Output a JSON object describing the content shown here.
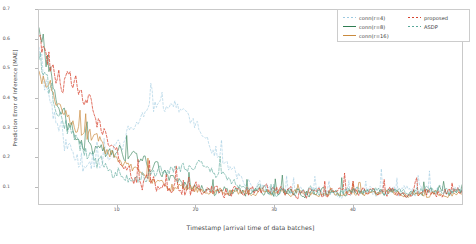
{
  "chart_data": {
    "type": "line",
    "title": "",
    "xlabel": "Timestamp [arrival time of data batches]",
    "ylabel": "Prediction Error of Inference [MAE]",
    "xlim": [
      0,
      54
    ],
    "ylim": [
      0.04,
      0.7
    ],
    "xticks": [
      10,
      20,
      30,
      40
    ],
    "yticks": [
      0.1,
      0.2,
      0.3,
      0.4,
      0.5,
      0.6,
      0.7
    ],
    "grid": false,
    "legend_position": "top-right",
    "n_points": 300,
    "series": [
      {
        "name": "conn(r=4)",
        "color": "#9ecae1",
        "dash": "2,2",
        "width": 0.6,
        "start": 0.6,
        "floor": 0.082,
        "decay": 0.052,
        "noise": 0.052,
        "seed": 11,
        "spike": 0.3,
        "spike_center": 0.3,
        "spike_width": 0.13
      },
      {
        "name": "conn(r=8)",
        "color": "#2f7d52",
        "dash": "0",
        "width": 0.6,
        "start": 0.66,
        "floor": 0.08,
        "decay": 0.075,
        "noise": 0.04,
        "seed": 27,
        "spike": 0.1,
        "spike_center": 0.22,
        "spike_width": 0.1
      },
      {
        "name": "conn(r=16)",
        "color": "#c98a3e",
        "dash": "0",
        "width": 0.7,
        "start": 0.5,
        "floor": 0.074,
        "decay": 0.11,
        "noise": 0.026,
        "seed": 43,
        "spike": 0.06,
        "spike_center": 0.14,
        "spike_width": 0.09
      },
      {
        "name": "proposed",
        "color": "#d6442f",
        "dash": "2.5,1.6",
        "width": 0.75,
        "start": 0.62,
        "floor": 0.079,
        "decay": 0.09,
        "noise": 0.046,
        "seed": 61,
        "spike": 0.16,
        "spike_center": 0.11,
        "spike_width": 0.07
      },
      {
        "name": "ASDP",
        "color": "#5aa89a",
        "dash": "3,1.5",
        "width": 0.6,
        "start": 0.55,
        "floor": 0.083,
        "decay": 0.085,
        "noise": 0.038,
        "seed": 79,
        "spike": 0.08,
        "spike_center": 0.36,
        "spike_width": 0.11
      }
    ]
  },
  "legend": {
    "left_column": [
      {
        "label": "conn(r=4)",
        "color": "#9ecae1",
        "dashed": true
      },
      {
        "label": "conn(r=8)",
        "color": "#2f7d52",
        "dashed": false
      },
      {
        "label": "conn(r=16)",
        "color": "#c98a3e",
        "dashed": false
      }
    ],
    "right_column": [
      {
        "label": "proposed",
        "color": "#d6442f",
        "dashed": true
      },
      {
        "label": "ASDP",
        "color": "#5aa89a",
        "dashed": true
      }
    ]
  },
  "axis": {
    "x_tick_labels": [
      "10",
      "20",
      "30",
      "40"
    ],
    "y_tick_labels": [
      "0.1",
      "0.2",
      "0.3",
      "0.4",
      "0.5",
      "0.6",
      "0.7"
    ]
  }
}
